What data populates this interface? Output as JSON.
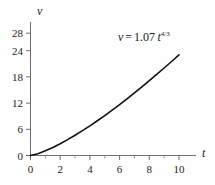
{
  "chart_data": {
    "type": "line",
    "title": "",
    "subtitle": "",
    "xlabel": "t",
    "ylabel": "v",
    "xlim": [
      0,
      11.3
    ],
    "ylim": [
      0,
      30.5
    ],
    "grid": false,
    "legend": null,
    "annotations": [
      {
        "name": "equation",
        "text": "v = 1.07 t^4/3",
        "lhs": "v",
        "equals": "=",
        "coefficient": "1.07",
        "variable": "t",
        "exponent": "4/3",
        "x": 7.6,
        "y": 27.0
      }
    ],
    "formula": "v = 1.07 * t^(4/3)",
    "x": [
      0,
      0.5,
      1,
      1.5,
      2,
      2.5,
      3,
      3.5,
      4,
      4.5,
      5,
      5.5,
      6,
      6.5,
      7,
      7.5,
      8,
      8.5,
      9,
      9.5,
      10
    ],
    "y": [
      0,
      0.42,
      1.07,
      1.84,
      2.69,
      3.63,
      4.63,
      5.69,
      6.79,
      7.95,
      9.15,
      10.39,
      11.67,
      12.98,
      14.33,
      15.71,
      17.12,
      18.56,
      20.03,
      21.52,
      23.05
    ],
    "series": [
      {
        "name": "v(t)",
        "color": "#111111",
        "linewidth": 1.6,
        "values": [
          0,
          0.42,
          1.07,
          1.84,
          2.69,
          3.63,
          4.63,
          5.69,
          6.79,
          7.95,
          9.15,
          10.39,
          11.67,
          12.98,
          14.33,
          15.71,
          17.12,
          18.56,
          20.03,
          21.52,
          23.05
        ]
      }
    ],
    "xticks": [
      0,
      2,
      4,
      6,
      8,
      10
    ],
    "xtick_labels": [
      "0",
      "2",
      "4",
      "6",
      "8",
      "10"
    ],
    "xminor_ticks": [
      1,
      3,
      5,
      7,
      9
    ],
    "yticks": [
      0,
      6,
      12,
      18,
      24,
      28
    ],
    "ytick_labels": [
      "0",
      "6",
      "12",
      "18",
      "24",
      "28"
    ],
    "axis_color": "#6f6f6f",
    "background": "#fefefe"
  }
}
